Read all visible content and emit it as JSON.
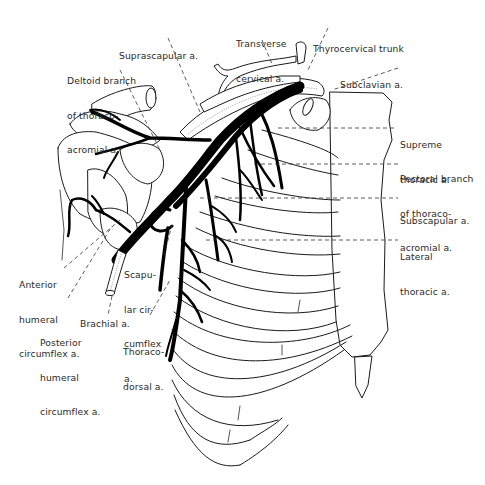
{
  "figure": {
    "colors": {
      "ink": "#000000",
      "background": "#ffffff",
      "label": "#2a2a2a"
    }
  },
  "labels": {
    "suprascapular": {
      "lines": [
        "Suprascapular a."
      ]
    },
    "transverse_cervical": {
      "lines": [
        "Transverse",
        "cervical a."
      ]
    },
    "thyrocervical_trunk": {
      "lines": [
        "Thyrocervical trunk"
      ]
    },
    "deltoid_branch": {
      "lines": [
        "Deltoid branch",
        "of thoraco-",
        "acromial a."
      ]
    },
    "subclavian": {
      "lines": [
        "Subclavian a."
      ]
    },
    "supreme_thoracic": {
      "lines": [
        "Supreme",
        "thoracic a."
      ]
    },
    "pectoral_branch": {
      "lines": [
        "Pectoral branch",
        "of thoraco-",
        "acromial a."
      ]
    },
    "subscapular": {
      "lines": [
        "Subscapular a."
      ]
    },
    "lateral_thoracic": {
      "lines": [
        "Lateral",
        "thoracic a."
      ]
    },
    "anterior_humeral_circumflex": {
      "lines": [
        "Anterior",
        "humeral",
        "circumflex a."
      ]
    },
    "scapular_circumflex": {
      "lines": [
        "Scapu-",
        "lar cir-",
        "cumflex",
        "a."
      ]
    },
    "brachial": {
      "lines": [
        "Brachial a."
      ]
    },
    "posterior_humeral_circumflex": {
      "lines": [
        "Posterior",
        "humeral",
        "circumflex a."
      ]
    },
    "thoracodorsal": {
      "lines": [
        "Thoraco-",
        "dorsal a."
      ]
    }
  }
}
